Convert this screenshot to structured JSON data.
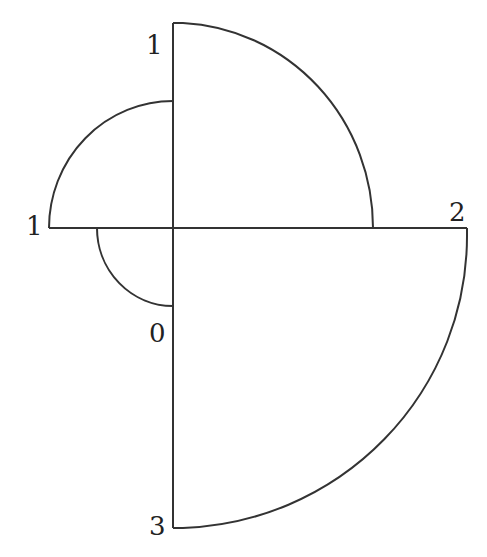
{
  "diagram": {
    "center": {
      "x": 173,
      "y": 228
    },
    "axes": {
      "up": {
        "label": "1",
        "length": 205
      },
      "right": {
        "label": "2",
        "length": 294
      },
      "down": {
        "label": "3",
        "length": 300
      },
      "left": {
        "label": "1",
        "length": 124
      }
    },
    "sectors": [
      {
        "quadrant": "upper-right",
        "radius": 200
      },
      {
        "quadrant": "upper-left",
        "radius": 125
      },
      {
        "quadrant": "lower-left",
        "radius": 77
      },
      {
        "quadrant": "lower-right",
        "radius": 297
      }
    ],
    "labels": {
      "top": "1",
      "left": "1",
      "right": "2",
      "zero": "0",
      "bottom": "3"
    },
    "colors": {
      "line": "#333333",
      "text": "#222222",
      "background": "#ffffff"
    }
  }
}
